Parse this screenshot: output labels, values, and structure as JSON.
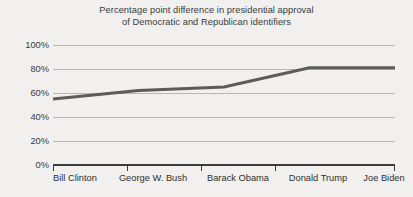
{
  "chart_data": {
    "type": "line",
    "title": "Percentage point difference in presidential approval\nof Democratic and Republican identifiers",
    "xlabel": "",
    "ylabel": "",
    "categories": [
      "Bill Clinton",
      "George W. Bush",
      "Barack Obama",
      "Donald Trump",
      "Joe Biden"
    ],
    "series": [
      {
        "name": "Percentage point difference",
        "values": [
          55,
          62,
          65,
          81,
          81
        ]
      }
    ],
    "ylim": [
      0,
      100
    ],
    "yticks": [
      0,
      20,
      40,
      60,
      80,
      100
    ],
    "ytick_labels": [
      "0%",
      "20%",
      "40%",
      "60%",
      "80%",
      "100%"
    ],
    "grid": true,
    "legend": false,
    "legend_position": "none",
    "line_color": "#5b5b5b",
    "grid_color": "#b9b7b4",
    "axis_color": "#3c3c3c",
    "background_color": "#f1f0ee",
    "text_color": "#3a3a3a"
  }
}
